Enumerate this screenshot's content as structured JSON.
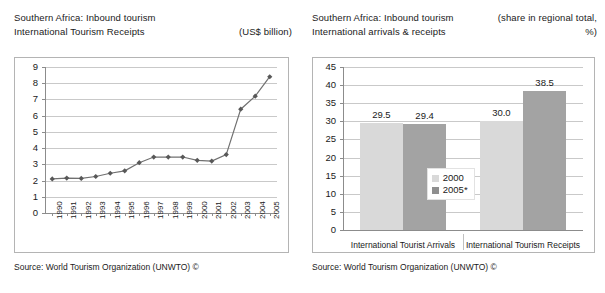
{
  "left_panel": {
    "title_line1": "Southern Africa: Inbound tourism",
    "title_line2": "International Tourism Receipts",
    "unit": "(US$ billion)",
    "source": "Source: World Tourism Organization (UNWTO) ©",
    "chart_data": {
      "type": "line",
      "title": "Southern Africa: Inbound tourism - International Tourism Receipts",
      "xlabel": "",
      "ylabel": "US$ billion",
      "ylim": [
        0,
        9
      ],
      "yticks": [
        0,
        1,
        2,
        3,
        4,
        5,
        6,
        7,
        8,
        9
      ],
      "ytick_labels": [
        "0",
        "1",
        "2",
        "3",
        "4",
        "5",
        "6",
        "7",
        "8",
        "9"
      ],
      "grid": true,
      "legend": "none",
      "marker": "diamond",
      "line_color": "#707070",
      "marker_color": "#585858",
      "categories": [
        "1990",
        "1991",
        "1992",
        "1993",
        "1994",
        "1995",
        "1996",
        "1997",
        "1998",
        "1999",
        "2000",
        "2001",
        "2002",
        "2003",
        "2004",
        "2005"
      ],
      "values": [
        2.1,
        2.15,
        2.13,
        2.25,
        2.45,
        2.6,
        3.1,
        3.45,
        3.45,
        3.45,
        3.25,
        3.2,
        3.6,
        6.4,
        7.2,
        8.4
      ]
    }
  },
  "right_panel": {
    "title_line1": "Southern Africa: Inbound tourism",
    "title_line2": "International arrivals & receipts",
    "unit_line1": "(share in regional total,",
    "unit_line2": "%)",
    "source": "Source: World Tourism Organization (UNWTO) ©",
    "chart_data": {
      "type": "bar",
      "title": "Southern Africa: Inbound tourism - International arrivals & receipts",
      "xlabel": "",
      "ylabel": "share in regional total, %",
      "ylim": [
        0,
        45
      ],
      "yticks": [
        0,
        5,
        10,
        15,
        20,
        25,
        30,
        35,
        40,
        45
      ],
      "ytick_labels": [
        "0",
        "5",
        "10",
        "15",
        "20",
        "25",
        "30",
        "35",
        "40",
        "45"
      ],
      "grid": true,
      "legend_position": "center",
      "categories": [
        "International Tourist Arrivals",
        "International Tourism Receipts"
      ],
      "series": [
        {
          "name": "2000",
          "color": "#d9d9d9",
          "values": [
            29.5,
            30.0
          ],
          "labels": [
            "29.5",
            "30.0"
          ]
        },
        {
          "name": "2005*",
          "color": "#a3a3a3",
          "values": [
            29.4,
            38.5
          ],
          "labels": [
            "29.4",
            "38.5"
          ]
        }
      ]
    }
  }
}
